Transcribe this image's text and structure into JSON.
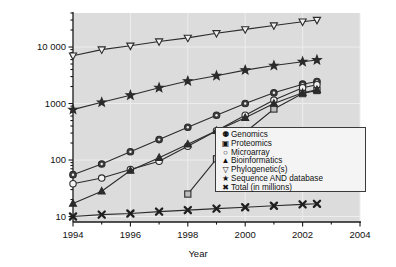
{
  "chart_data": {
    "type": "line",
    "title": "",
    "xlabel": "Year",
    "ylabel": "Number of articles",
    "xlim": [
      1994,
      2004
    ],
    "ylim": [
      8,
      40000
    ],
    "yscale": "log",
    "grid": true,
    "legend_position": "inside-lower-right",
    "xticks": [
      "1994",
      "1996",
      "1998",
      "2000",
      "2002",
      "2004"
    ],
    "xtick_values": [
      1994,
      1996,
      1998,
      2000,
      2002,
      2004
    ],
    "yticks": [
      "10",
      "100",
      "1000",
      "10 000"
    ],
    "ytick_values": [
      10,
      100,
      1000,
      10000
    ],
    "series": [
      {
        "name": "Genomics",
        "marker": "circle-filled",
        "x": [
          1994,
          1995,
          1996,
          1997,
          1998,
          1999,
          2000,
          2001,
          2002,
          2002.5
        ],
        "values": [
          55,
          85,
          140,
          230,
          380,
          620,
          1000,
          1550,
          2200,
          2450
        ]
      },
      {
        "name": "Proteomics",
        "marker": "square-open",
        "x": [
          1998,
          1999,
          2000,
          2001,
          2002,
          2002.5
        ],
        "values": [
          25,
          105,
          310,
          800,
          1500,
          1700
        ]
      },
      {
        "name": "Microarray",
        "marker": "circle-open",
        "x": [
          1994,
          1995,
          1996,
          1997,
          1998,
          1999,
          2000,
          2001,
          2002,
          2002.5
        ],
        "values": [
          38,
          48,
          68,
          95,
          175,
          330,
          620,
          1150,
          1900,
          2150
        ]
      },
      {
        "name": "Bioinformatics",
        "marker": "triangle-up",
        "x": [
          1994,
          1995,
          1996,
          1997,
          1998,
          1999,
          2000,
          2001,
          2002,
          2002.5
        ],
        "values": [
          17,
          28,
          65,
          110,
          190,
          330,
          560,
          1000,
          1550,
          1750
        ]
      },
      {
        "name": "Phylogenetic(s)",
        "marker": "triangle-down",
        "x": [
          1994,
          1995,
          1996,
          1997,
          1998,
          1999,
          2000,
          2001,
          2002,
          2002.5
        ],
        "values": [
          7000,
          9000,
          10500,
          12500,
          14500,
          17500,
          20500,
          24000,
          28000,
          30000
        ]
      },
      {
        "name": "Sequence AND database",
        "marker": "star",
        "x": [
          1994,
          1995,
          1996,
          1997,
          1998,
          1999,
          2000,
          2001,
          2002,
          2002.5
        ],
        "values": [
          780,
          1050,
          1400,
          1900,
          2500,
          3100,
          3900,
          4700,
          5500,
          5900
        ]
      },
      {
        "name": "Total (in millions)",
        "marker": "cross",
        "x": [
          1994,
          1995,
          1996,
          1997,
          1998,
          1999,
          2000,
          2001,
          2002,
          2002.5
        ],
        "values": [
          10.0,
          10.8,
          11.3,
          12.2,
          13.0,
          13.8,
          14.6,
          15.5,
          16.4,
          16.8
        ]
      }
    ]
  },
  "legend": {
    "items": [
      {
        "label": "Genomics",
        "glyph": "⚉"
      },
      {
        "label": "Proteomics",
        "glyph": "▣"
      },
      {
        "label": "Microarray",
        "glyph": "○"
      },
      {
        "label": "Bioinformatics",
        "glyph": "▲"
      },
      {
        "label": "Phylogenetic(s)",
        "glyph": "▽"
      },
      {
        "label": "Sequence AND database",
        "glyph": "★"
      },
      {
        "label": "Total (in millions)",
        "glyph": "✖"
      }
    ]
  },
  "colors": {
    "plot_background": "#dcdcdc",
    "figure_background": "#ffffff",
    "line": "#2b2b2b",
    "grid": "#ededed",
    "axis": "#1a1a1a",
    "legend_background": "#f4f4f4",
    "legend_border": "#3a3a3a"
  }
}
